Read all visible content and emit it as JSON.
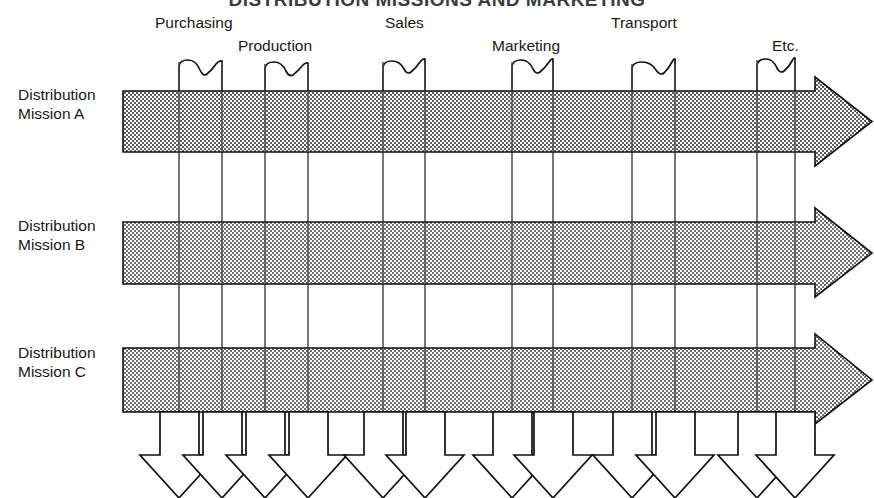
{
  "title": {
    "text": "DISTRIBUTION MISSIONS AND MARKETING",
    "note": "clipped at top edge of image"
  },
  "diagram": {
    "type": "distribution-mission-matrix",
    "fill_color": "#b4b4b4",
    "line_color": "#111111",
    "background": "#ffffff"
  },
  "columns": [
    {
      "label": "Purchasing",
      "label_x": 155,
      "label_y": 28,
      "brace_left": 179,
      "brace_right": 222
    },
    {
      "label": "Production",
      "label_x": 238,
      "label_y": 51,
      "brace_left": 265,
      "brace_right": 308
    },
    {
      "label": "Sales",
      "label_x": 385,
      "label_y": 28,
      "brace_left": 383,
      "brace_right": 425
    },
    {
      "label": "Marketing",
      "label_x": 492,
      "label_y": 51,
      "brace_left": 512,
      "brace_right": 553
    },
    {
      "label": "Transport",
      "label_x": 611,
      "label_y": 28,
      "brace_left": 632,
      "brace_right": 675
    },
    {
      "label": "Etc.",
      "label_x": 772,
      "label_y": 51,
      "brace_left": 757,
      "brace_right": 795
    }
  ],
  "rows": [
    {
      "label_line1": "Distribution",
      "label_line2": "Mission A",
      "label_x": 18,
      "label_y": 105,
      "band_top": 91,
      "band_bottom": 152
    },
    {
      "label_line1": "Distribution",
      "label_line2": "Mission B",
      "label_x": 18,
      "label_y": 236,
      "band_top": 222,
      "band_bottom": 284
    },
    {
      "label_line1": "Distribution",
      "label_line2": "Mission C",
      "label_x": 18,
      "label_y": 363,
      "band_top": 348,
      "band_bottom": 412
    }
  ],
  "band_geometry": {
    "left_x": 123,
    "shaft_right_x": 815,
    "tip_x": 872,
    "head_overhang": 14
  },
  "vertical_lines": [
    179,
    222,
    265,
    308,
    383,
    425,
    512,
    553,
    632,
    675,
    757,
    795
  ],
  "vertical_line_top": 62,
  "vertical_line_bottom": 418,
  "down_arrows": {
    "stem_half_width": 21,
    "stem_top_y": 412,
    "stem_bottom_y": 455,
    "head_half_width": 40,
    "tip_y": 498,
    "centers": [
      179,
      222,
      265,
      308,
      383,
      425,
      512,
      553,
      632,
      675,
      757,
      795
    ]
  }
}
